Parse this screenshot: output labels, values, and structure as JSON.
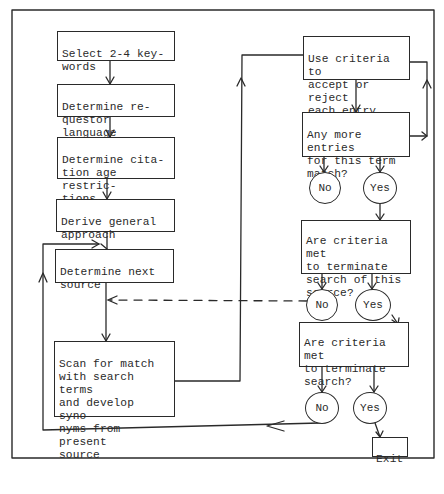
{
  "diagram": {
    "type": "flowchart",
    "title": "",
    "colors": {
      "ink": "#2a2a2a",
      "paper": "#ffffff"
    },
    "process_steps": [
      {
        "id": "s1",
        "label": "Select 2-4 key-\nwords"
      },
      {
        "id": "s2",
        "label": "Determine re-\nquestor language"
      },
      {
        "id": "s3",
        "label": "Determine cita-\ntion age restric-\ntions"
      },
      {
        "id": "s4",
        "label": "Derive general\napproach"
      },
      {
        "id": "s5",
        "label": "Determine next\nsource"
      },
      {
        "id": "s6",
        "label": "Scan for match\nwith search terms\nand develop syno-\nnyms from present\nsource"
      },
      {
        "id": "s7",
        "label": "Use criteria to\naccept or reject\neach entry"
      }
    ],
    "decisions": [
      {
        "id": "d1",
        "label": "Any more entries\nfor this term\nmatch?",
        "no": "No",
        "yes": "Yes"
      },
      {
        "id": "d2",
        "label": "Are criteria met\nto terminate\nsearch of this\nsource?",
        "no": "No",
        "yes": "Yes"
      },
      {
        "id": "d3",
        "label": "Are criteria met\nto terminate\nsearch?",
        "no": "No",
        "yes": "Yes"
      }
    ],
    "terminal": {
      "id": "exit",
      "label": "Exit"
    },
    "edges": [
      {
        "from": "s1",
        "to": "s2",
        "style": "solid"
      },
      {
        "from": "s2",
        "to": "s3",
        "style": "solid"
      },
      {
        "from": "s3",
        "to": "s4",
        "style": "solid"
      },
      {
        "from": "s4",
        "to": "s5",
        "style": "solid"
      },
      {
        "from": "s5",
        "to": "s6",
        "style": "solid"
      },
      {
        "from": "s6",
        "to": "s7",
        "style": "solid"
      },
      {
        "from": "s7",
        "to": "d1",
        "style": "solid"
      },
      {
        "from": "d1.yes",
        "to": "d2",
        "style": "solid"
      },
      {
        "from": "d1.no",
        "to": "s7",
        "style": "solid"
      },
      {
        "from": "d2.no",
        "to": "s5",
        "style": "dashed"
      },
      {
        "from": "d2.yes",
        "to": "d3",
        "style": "solid"
      },
      {
        "from": "d3.no",
        "to": "s5",
        "style": "solid"
      },
      {
        "from": "d3.yes",
        "to": "exit",
        "style": "solid"
      }
    ]
  }
}
